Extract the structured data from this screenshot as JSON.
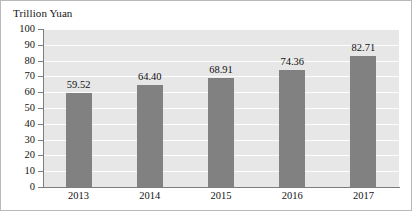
{
  "chart_data": {
    "type": "bar",
    "title": "Trillion Yuan",
    "xlabel": "",
    "ylabel": "Trillion Yuan",
    "categories": [
      "2013",
      "2014",
      "2015",
      "2016",
      "2017"
    ],
    "values": [
      59.52,
      64.4,
      68.91,
      74.36,
      82.71
    ],
    "value_labels": [
      "59.52",
      "64.40",
      "68.91",
      "74.36",
      "82.71"
    ],
    "ylim": [
      0,
      100
    ],
    "ytick_labels": [
      "100",
      "90",
      "80",
      "70",
      "60",
      "50",
      "40",
      "30",
      "20",
      "10",
      "0"
    ],
    "ytick_values": [
      100,
      90,
      80,
      70,
      60,
      50,
      40,
      30,
      20,
      10,
      0
    ],
    "grid": "horizontal",
    "legend": "none",
    "series": [
      {
        "name": "Trillion Yuan",
        "values": [
          59.52,
          64.4,
          68.91,
          74.36,
          82.71
        ]
      }
    ],
    "colors": {
      "bar": "#818181",
      "plot_background": "#e7e7e7",
      "gridline": "#fdfdfd",
      "axis": "#7d7d7d",
      "text": "#141414",
      "frame_border": "#b9b9b9"
    }
  }
}
